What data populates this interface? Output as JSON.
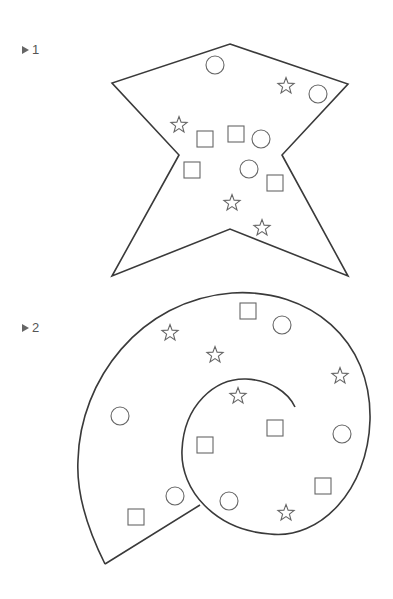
{
  "puzzles": [
    {
      "number": "1",
      "outline": "star-shaped polygon",
      "items": [
        {
          "type": "circle",
          "x": 215,
          "y": 65
        },
        {
          "type": "star",
          "x": 286,
          "y": 86
        },
        {
          "type": "circle",
          "x": 318,
          "y": 94
        },
        {
          "type": "star",
          "x": 179,
          "y": 125
        },
        {
          "type": "square",
          "x": 205,
          "y": 139
        },
        {
          "type": "square",
          "x": 236,
          "y": 134
        },
        {
          "type": "circle",
          "x": 261,
          "y": 139
        },
        {
          "type": "square",
          "x": 192,
          "y": 170
        },
        {
          "type": "circle",
          "x": 249,
          "y": 169
        },
        {
          "type": "square",
          "x": 275,
          "y": 183
        },
        {
          "type": "star",
          "x": 232,
          "y": 203
        },
        {
          "type": "star",
          "x": 262,
          "y": 228
        }
      ]
    },
    {
      "number": "2",
      "outline": "spiral shell",
      "items": [
        {
          "type": "square",
          "x": 248,
          "y": 311
        },
        {
          "type": "circle",
          "x": 282,
          "y": 325
        },
        {
          "type": "star",
          "x": 170,
          "y": 333
        },
        {
          "type": "star",
          "x": 215,
          "y": 355
        },
        {
          "type": "star",
          "x": 340,
          "y": 376
        },
        {
          "type": "star",
          "x": 238,
          "y": 396
        },
        {
          "type": "circle",
          "x": 120,
          "y": 416
        },
        {
          "type": "square",
          "x": 275,
          "y": 428
        },
        {
          "type": "circle",
          "x": 342,
          "y": 434
        },
        {
          "type": "square",
          "x": 205,
          "y": 445
        },
        {
          "type": "square",
          "x": 323,
          "y": 486
        },
        {
          "type": "circle",
          "x": 175,
          "y": 496
        },
        {
          "type": "circle",
          "x": 229,
          "y": 501
        },
        {
          "type": "star",
          "x": 286,
          "y": 513
        },
        {
          "type": "square",
          "x": 136,
          "y": 517
        }
      ]
    }
  ],
  "colors": {
    "outline": "#3a3a3a",
    "item": "#666666",
    "label": "#555555"
  }
}
